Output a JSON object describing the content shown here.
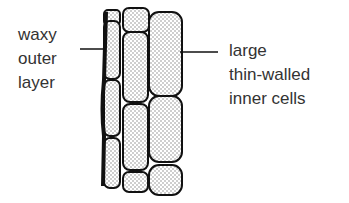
{
  "labels": {
    "left": [
      "waxy",
      "outer",
      "layer"
    ],
    "right": [
      "large",
      "thin-walled",
      "inner cells"
    ]
  },
  "colors": {
    "ink": "#111111",
    "fill": "#e6e6e6",
    "text": "#333333"
  }
}
